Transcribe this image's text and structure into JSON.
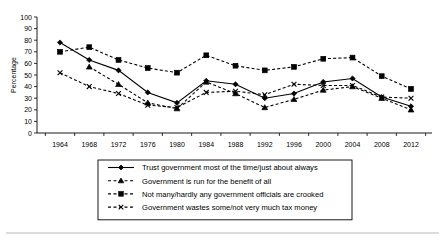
{
  "chart_data": {
    "type": "line",
    "title": "",
    "xlabel": "",
    "ylabel": "Percentage",
    "ylim": [
      0,
      100
    ],
    "ytick_step": 10,
    "grid": false,
    "legend_position": "below-plot",
    "categories": [
      1964,
      1968,
      1972,
      1976,
      1980,
      1984,
      1988,
      1992,
      1996,
      2000,
      2004,
      2008,
      2012
    ],
    "yticks": [
      0,
      10,
      20,
      30,
      40,
      50,
      60,
      70,
      80,
      90,
      100
    ],
    "series": [
      {
        "name": "Trust government most of the time/just about always",
        "marker": "diamond",
        "dash": "solid",
        "values": [
          78,
          63,
          54,
          35,
          26,
          45,
          42,
          30,
          34,
          44,
          47,
          31,
          23
        ]
      },
      {
        "name": "Government is run for the benefit of all",
        "marker": "triangle",
        "dash": "dashed",
        "values": [
          null,
          57,
          42,
          26,
          21,
          44,
          34,
          22,
          29,
          37,
          40,
          30,
          20
        ]
      },
      {
        "name": "Not many/hardly any government officials are crooked",
        "marker": "square",
        "dash": "dashed",
        "values": [
          70,
          74,
          63,
          56,
          52,
          67,
          58,
          54,
          57,
          64,
          65,
          49,
          38
        ]
      },
      {
        "name": "Government wastes some/not very much tax money",
        "marker": "x",
        "dash": "dashed",
        "values": [
          52,
          40,
          34,
          24,
          22,
          35,
          36,
          33,
          42,
          41,
          41,
          31,
          30
        ]
      }
    ]
  },
  "legend": {
    "items": [
      {
        "label": "Trust government most of the time/just about always"
      },
      {
        "label": "Government is run for the benefit of all"
      },
      {
        "label": "Not many/hardly any government officials are crooked"
      },
      {
        "label": "Government wastes some/not very much tax money"
      }
    ]
  },
  "colors": {
    "ink": "#000000",
    "rule": "#b9b9b9",
    "background": "#ffffff"
  }
}
